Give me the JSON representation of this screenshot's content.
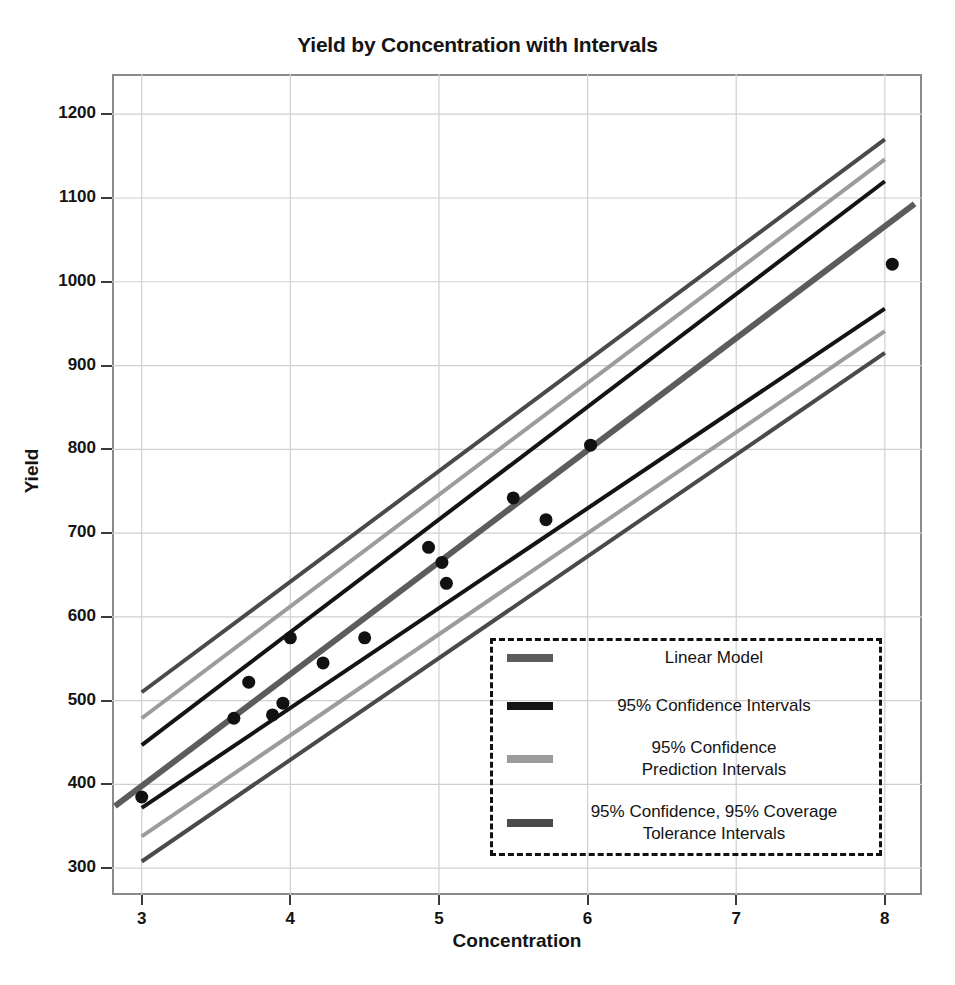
{
  "chart_data": {
    "type": "scatter",
    "title": "Yield by Concentration with Intervals",
    "xlabel": "Concentration",
    "ylabel": "Yield",
    "xlim": [
      2.8,
      8.25
    ],
    "ylim": [
      268,
      1248
    ],
    "xticks": [
      3,
      4,
      5,
      6,
      7,
      8
    ],
    "yticks": [
      300,
      400,
      500,
      600,
      700,
      800,
      900,
      1000,
      1100,
      1200
    ],
    "grid": true,
    "legend_position": "lower right",
    "points": [
      {
        "x": 3.0,
        "y": 385
      },
      {
        "x": 3.62,
        "y": 479
      },
      {
        "x": 3.72,
        "y": 522
      },
      {
        "x": 3.88,
        "y": 483
      },
      {
        "x": 3.95,
        "y": 497
      },
      {
        "x": 4.0,
        "y": 575
      },
      {
        "x": 4.22,
        "y": 545
      },
      {
        "x": 4.5,
        "y": 575
      },
      {
        "x": 4.93,
        "y": 683
      },
      {
        "x": 5.02,
        "y": 665
      },
      {
        "x": 5.05,
        "y": 640
      },
      {
        "x": 5.5,
        "y": 742
      },
      {
        "x": 5.72,
        "y": 716
      },
      {
        "x": 6.02,
        "y": 805
      },
      {
        "x": 8.05,
        "y": 1021
      }
    ],
    "lines": [
      {
        "name": "Linear Model",
        "color": "#5c5c5c",
        "width": 6,
        "x": [
          2.82,
          8.2
        ],
        "y": [
          374,
          1093
        ]
      },
      {
        "name": "95% Confidence Intervals (upper)",
        "color": "#141414",
        "width": 4,
        "x": [
          3.0,
          8.0
        ],
        "y": [
          447,
          1120
        ]
      },
      {
        "name": "95% Confidence Intervals (lower)",
        "color": "#141414",
        "width": 4,
        "x": [
          3.0,
          8.0
        ],
        "y": [
          372,
          968
        ]
      },
      {
        "name": "95% Confidence Prediction Intervals (upper)",
        "color": "#9c9c9c",
        "width": 4,
        "x": [
          3.0,
          8.0
        ],
        "y": [
          479,
          1146
        ]
      },
      {
        "name": "95% Confidence Prediction Intervals (lower)",
        "color": "#9c9c9c",
        "width": 4,
        "x": [
          3.0,
          8.0
        ],
        "y": [
          338,
          941
        ]
      },
      {
        "name": "95% Confidence, 95% Coverage Tolerance Intervals (upper)",
        "color": "#4a4a4a",
        "width": 4,
        "x": [
          3.0,
          8.0
        ],
        "y": [
          510,
          1170
        ]
      },
      {
        "name": "95% Confidence, 95% Coverage Tolerance Intervals (lower)",
        "color": "#4a4a4a",
        "width": 4,
        "x": [
          3.0,
          8.0
        ],
        "y": [
          308,
          915
        ]
      }
    ],
    "point_color": "#111111",
    "point_radius": 6.5,
    "grid_color": "#d0d0d0",
    "frame_color": "#8a8a8a",
    "legend": [
      {
        "label": "Linear Model",
        "color": "#5c5c5c",
        "lines": [
          "Linear Model"
        ]
      },
      {
        "label": "95% Confidence Intervals",
        "color": "#141414",
        "lines": [
          "95% Confidence Intervals"
        ]
      },
      {
        "label": "95% Confidence Prediction Intervals",
        "color": "#9c9c9c",
        "lines": [
          "95% Confidence",
          "Prediction Intervals"
        ]
      },
      {
        "label": "95% Confidence, 95% Coverage Tolerance Intervals",
        "color": "#4a4a4a",
        "lines": [
          "95% Confidence, 95% Coverage",
          "Tolerance Intervals"
        ]
      }
    ]
  }
}
